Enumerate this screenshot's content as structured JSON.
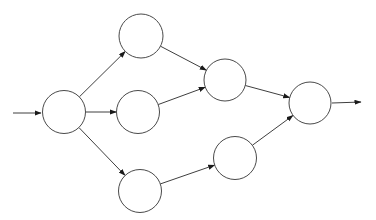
{
  "diagram": {
    "canvas": {
      "width": 376,
      "height": 220,
      "background": "#ffffff"
    },
    "style": {
      "edge_color": "#3f3f3f",
      "arrow_color": "#1a1a1a",
      "node_stroke": "#4a4a4a",
      "node_fill": "#ffffff",
      "stroke_width": 1
    },
    "nodes": [
      {
        "id": "source",
        "label": "",
        "x": 64,
        "y": 112,
        "r": 21.5
      },
      {
        "id": "top",
        "label": "",
        "x": 141,
        "y": 36,
        "r": 22
      },
      {
        "id": "middle",
        "label": "",
        "x": 138,
        "y": 112,
        "r": 21.5
      },
      {
        "id": "bottom",
        "label": "",
        "x": 140,
        "y": 191,
        "r": 21.5
      },
      {
        "id": "merge-upper",
        "label": "",
        "x": 225,
        "y": 80,
        "r": 21
      },
      {
        "id": "merge-lower",
        "label": "",
        "x": 235,
        "y": 158,
        "r": 21.5
      },
      {
        "id": "sink",
        "label": "",
        "x": 310,
        "y": 103,
        "r": 21
      }
    ],
    "edges": [
      {
        "from": "source",
        "to": "top"
      },
      {
        "from": "source",
        "to": "middle"
      },
      {
        "from": "source",
        "to": "bottom"
      },
      {
        "from": "top",
        "to": "merge-upper"
      },
      {
        "from": "middle",
        "to": "merge-upper"
      },
      {
        "from": "bottom",
        "to": "merge-lower"
      },
      {
        "from": "merge-upper",
        "to": "sink"
      },
      {
        "from": "merge-lower",
        "to": "sink"
      }
    ],
    "external_arrows": [
      {
        "name": "entry-arrow",
        "x1": 13,
        "y1": 113,
        "x2": 41,
        "y2": 113
      },
      {
        "name": "exit-arrow",
        "x1": 332,
        "y1": 103,
        "x2": 361,
        "y2": 102
      }
    ]
  }
}
